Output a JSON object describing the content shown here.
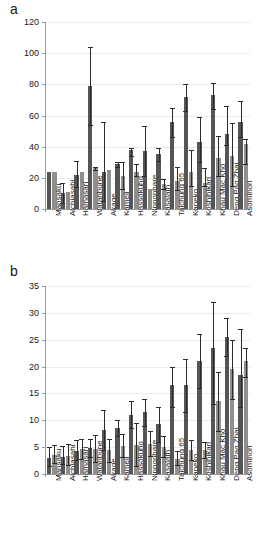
{
  "figure": {
    "panel_a_letter": "a",
    "panel_b_letter": "b"
  },
  "chart_data": [
    {
      "type": "bar",
      "panel": "a",
      "title": "",
      "xlabel": "",
      "ylabel": "",
      "ylim": [
        0,
        120
      ],
      "yticks": [
        0,
        20,
        40,
        60,
        80,
        100,
        120
      ],
      "grid": true,
      "legend": "none",
      "categories": [
        "Mansaku",
        "Aichiasahi",
        "Hamasari",
        "Wataribune",
        "Akage",
        "Kameji",
        "Hassokuho",
        "Nipponbare",
        "Kasalath",
        "Taichung 65",
        "Kaneko",
        "Koshihikari",
        "Khau Mac Kho",
        "Deng Pao Zhai",
        "Asominori"
      ],
      "series": [
        {
          "name": "dark",
          "color": "#555555",
          "values": [
            24,
            10,
            22,
            79,
            24,
            29,
            38,
            37,
            35,
            56,
            72,
            43,
            73,
            48,
            56
          ],
          "err_low": [
            24,
            4,
            14,
            54,
            5,
            27,
            34,
            21,
            31,
            46,
            63,
            30,
            64,
            41,
            46
          ],
          "err_high": [
            24,
            17,
            31,
            104,
            56,
            30,
            39,
            53,
            39,
            65,
            80,
            59,
            81,
            66,
            69
          ]
        },
        {
          "name": "light",
          "color": "#8f8f8f",
          "values": [
            24,
            11,
            24,
            27,
            25,
            21,
            24,
            13,
            16,
            18,
            24,
            17,
            33,
            34,
            42
          ],
          "err_low": [
            24,
            11,
            24,
            25,
            25,
            13,
            21,
            13,
            13,
            12,
            15,
            15,
            21,
            15,
            29
          ],
          "err_high": [
            24,
            11,
            24,
            27,
            25,
            30,
            29,
            13,
            19,
            27,
            38,
            26,
            47,
            55,
            45
          ]
        }
      ]
    },
    {
      "type": "bar",
      "panel": "b",
      "title": "",
      "xlabel": "",
      "ylabel": "",
      "ylim": [
        0,
        35
      ],
      "yticks": [
        0,
        5,
        10,
        15,
        20,
        25,
        30,
        35
      ],
      "grid": true,
      "legend": "none",
      "categories": [
        "Mansaku",
        "Aichiasahi",
        "Hamasari",
        "Wataribune",
        "Akage",
        "Kameji",
        "Hassokuho",
        "Nipponbare",
        "Kasalath",
        "Taichung 65",
        "Kaneko",
        "Koshihikari",
        "Khau Mac Kho",
        "Deng Pao Zhai",
        "Asominori"
      ],
      "series": [
        {
          "name": "dark",
          "color": "#555555",
          "values": [
            3.0,
            3.2,
            4.2,
            4.9,
            8.2,
            8.5,
            11.0,
            11.5,
            9.3,
            16.5,
            16.5,
            21.0,
            23.5,
            25.5,
            18.5
          ],
          "err_low": [
            1.5,
            1.8,
            2.6,
            3.2,
            4.5,
            7.0,
            8.5,
            9.0,
            6.0,
            12.5,
            11.5,
            16.0,
            13.0,
            22.0,
            12.5
          ],
          "err_high": [
            5.0,
            5.2,
            6.4,
            6.6,
            12.0,
            10.0,
            13.5,
            14.0,
            12.5,
            20.0,
            21.5,
            26.0,
            32.0,
            29.0,
            27.0
          ]
        },
        {
          "name": "light",
          "color": "#8f8f8f",
          "values": [
            3.6,
            3.4,
            4.6,
            4.6,
            4.4,
            5.2,
            5.4,
            5.6,
            5.0,
            2.8,
            4.4,
            4.4,
            13.5,
            19.5,
            21.0
          ],
          "err_low": [
            2.0,
            1.6,
            2.8,
            2.2,
            2.2,
            3.2,
            1.4,
            3.4,
            3.2,
            1.6,
            2.6,
            3.0,
            8.0,
            14.0,
            18.0
          ],
          "err_high": [
            5.4,
            5.6,
            6.6,
            7.2,
            6.6,
            7.4,
            9.5,
            8.0,
            7.0,
            4.2,
            6.4,
            6.0,
            19.0,
            25.0,
            23.5
          ]
        }
      ]
    }
  ]
}
